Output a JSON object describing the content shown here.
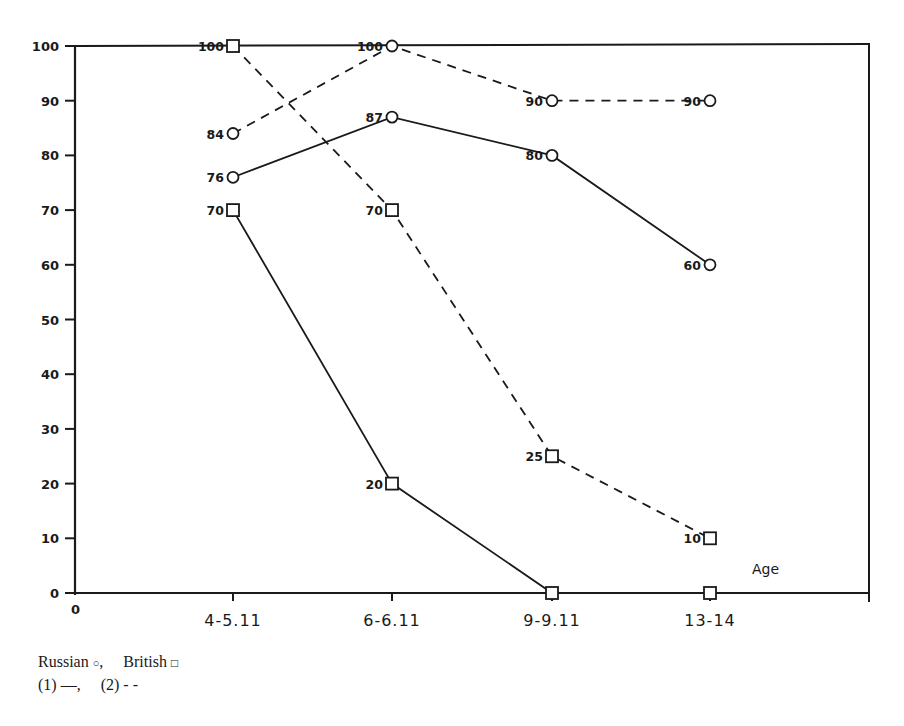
{
  "chart_data": {
    "type": "line",
    "title": "",
    "xlabel": "Age",
    "ylabel": "",
    "ylim": [
      0,
      100
    ],
    "yticks": [
      0,
      10,
      20,
      30,
      40,
      50,
      60,
      70,
      80,
      90,
      100
    ],
    "x_origin_label": "0",
    "categories": [
      "4-5.11",
      "6-6.11",
      "9-9.11",
      "13-14"
    ],
    "grid": false,
    "series": [
      {
        "name": "Russian (1)",
        "group": "Russian",
        "condition": "(1)",
        "marker": "circle",
        "line": "solid",
        "values": [
          76,
          87,
          80,
          60
        ],
        "labels": [
          "76",
          "87",
          "80",
          "60"
        ]
      },
      {
        "name": "Russian (2)",
        "group": "Russian",
        "condition": "(2)",
        "marker": "circle",
        "line": "dashed",
        "values": [
          84,
          100,
          90,
          90
        ],
        "labels": [
          "84",
          "100",
          "90",
          "90"
        ]
      },
      {
        "name": "British (1)",
        "group": "British",
        "condition": "(1)",
        "marker": "square",
        "line": "solid",
        "values": [
          70,
          20,
          0,
          0
        ],
        "labels": [
          "70",
          "20",
          "",
          ""
        ]
      },
      {
        "name": "British (2)",
        "group": "British",
        "condition": "(2)",
        "marker": "square",
        "line": "dashed",
        "values": [
          100,
          70,
          25,
          10
        ],
        "labels": [
          "100",
          "70",
          "25",
          "10"
        ]
      }
    ],
    "legend": {
      "position": "bottom-left",
      "line1": {
        "russian": "Russian",
        "russian_symbol": "○",
        "sep": ",",
        "british": "British",
        "british_symbol": "□"
      },
      "line2": {
        "c1": "(1)",
        "c1_symbol": "—",
        "sep": ",",
        "c2": "(2)",
        "c2_symbol": "- -"
      }
    }
  },
  "colors": {
    "ink": "#1a1a1a",
    "background": "#ffffff"
  }
}
